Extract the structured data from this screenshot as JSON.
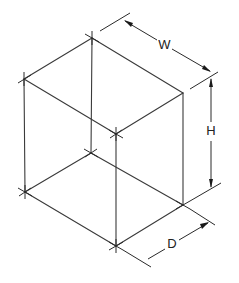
{
  "diagram": {
    "labels": {
      "width": "W",
      "height": "H",
      "depth": "D"
    },
    "colors": {
      "background": "#ffffff",
      "line": "#3a3a3a",
      "text": "#222222"
    },
    "vertices": {
      "top_back": [
        92,
        38
      ],
      "top_left": [
        24,
        79
      ],
      "top_right": [
        183,
        93
      ],
      "top_front": [
        116,
        134
      ],
      "bottom_back": [
        91,
        153
      ],
      "bottom_left": [
        25,
        192
      ],
      "bottom_right": [
        183,
        205
      ],
      "bottom_front": [
        116,
        246
      ]
    }
  }
}
